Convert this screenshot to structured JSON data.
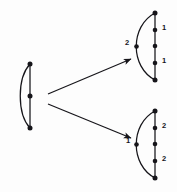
{
  "figure": {
    "kind": "graph-transformation-diagram",
    "background_color": "#fdfdfd",
    "ink_color": "#16151a",
    "vertex_color": "#16151a"
  },
  "graphs": {
    "source": {
      "name": "source-theta-graph",
      "spine": {
        "x": 30,
        "y_top": 64,
        "y_bottom": 128
      },
      "arc": {
        "bulge_x": 12,
        "direction": "left"
      },
      "vertices": [
        {
          "id": "s-top",
          "x": 30,
          "y": 64
        },
        {
          "id": "s-mid",
          "x": 30,
          "y": 96
        },
        {
          "id": "s-bottom",
          "x": 30,
          "y": 128
        }
      ],
      "arc_vertices": [],
      "labels": []
    },
    "upper_target": {
      "name": "upper-target-theta-graph",
      "spine": {
        "x": 155,
        "y_top": 13,
        "y_bottom": 80
      },
      "arc": {
        "bulge_x": 19,
        "direction": "left"
      },
      "vertices": [
        {
          "id": "u-top",
          "x": 155,
          "y": 13
        },
        {
          "id": "u-n1",
          "x": 155,
          "y": 30
        },
        {
          "id": "u-mid",
          "x": 155,
          "y": 46
        },
        {
          "id": "u-n2",
          "x": 155,
          "y": 63
        },
        {
          "id": "u-bottom",
          "x": 155,
          "y": 80
        }
      ],
      "arc_vertices": [
        {
          "id": "u-arc-mid",
          "x": 137,
          "y": 46
        }
      ],
      "labels": [
        {
          "id": "u-label-upper-right",
          "text": "1",
          "x": 163,
          "y": 27
        },
        {
          "id": "u-label-lower-right",
          "text": "1",
          "x": 163,
          "y": 60
        },
        {
          "id": "u-label-arc",
          "text": "2",
          "x": 127,
          "y": 42
        }
      ]
    },
    "lower_target": {
      "name": "lower-target-theta-graph",
      "spine": {
        "x": 155,
        "y_top": 111,
        "y_bottom": 178
      },
      "arc": {
        "bulge_x": 19,
        "direction": "left"
      },
      "vertices": [
        {
          "id": "l-top",
          "x": 155,
          "y": 111
        },
        {
          "id": "l-n1",
          "x": 155,
          "y": 128
        },
        {
          "id": "l-mid",
          "x": 155,
          "y": 144
        },
        {
          "id": "l-n2",
          "x": 155,
          "y": 161
        },
        {
          "id": "l-bottom",
          "x": 155,
          "y": 178
        }
      ],
      "arc_vertices": [
        {
          "id": "l-arc-mid",
          "x": 137,
          "y": 144
        }
      ],
      "labels": [
        {
          "id": "l-label-upper-right",
          "text": "2",
          "x": 163,
          "y": 125
        },
        {
          "id": "l-label-lower-right",
          "text": "2",
          "x": 163,
          "y": 158
        },
        {
          "id": "l-label-arc",
          "text": "1",
          "x": 127,
          "y": 140
        }
      ]
    }
  },
  "arrows": [
    {
      "id": "arrow-to-upper",
      "name": "arrow-to-upper-target",
      "from": {
        "x": 48,
        "y": 94
      },
      "to": {
        "x": 133,
        "y": 58
      }
    },
    {
      "id": "arrow-to-lower",
      "name": "arrow-to-lower-target",
      "from": {
        "x": 48,
        "y": 104
      },
      "to": {
        "x": 133,
        "y": 139
      }
    }
  ],
  "label_texts": {
    "upper_one_a": "1",
    "upper_one_b": "1",
    "upper_two": "2",
    "lower_two_a": "2",
    "lower_two_b": "2",
    "lower_one": "1"
  }
}
